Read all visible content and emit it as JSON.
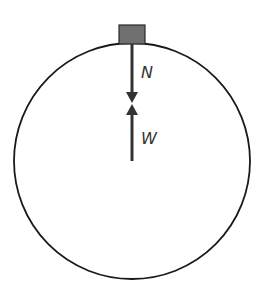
{
  "diagram": {
    "title": "",
    "labels": {
      "normal_force": "N",
      "weight": "W"
    },
    "colors": {
      "circle_stroke": "#1a1a1a",
      "block_fill": "#6f6f6f",
      "block_stroke": "#2a2a2a",
      "arrow": "#333333",
      "label": "#333333"
    }
  }
}
